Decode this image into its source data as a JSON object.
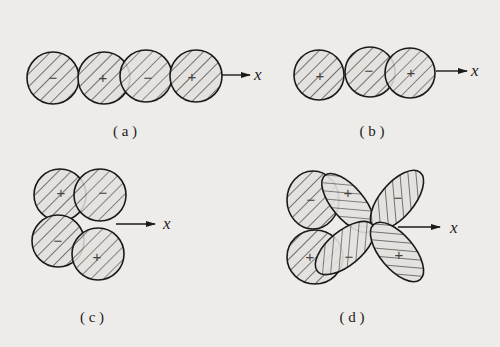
{
  "figure": {
    "panels": [
      {
        "id": "a",
        "caption": "( a )",
        "axis_label": "x",
        "lobes": [
          {
            "sign": "−"
          },
          {
            "sign": "+"
          },
          {
            "sign": "−"
          },
          {
            "sign": "+"
          }
        ]
      },
      {
        "id": "b",
        "caption": "( b )",
        "axis_label": "x",
        "lobes": [
          {
            "sign": "+"
          },
          {
            "sign": "−"
          },
          {
            "sign": "+"
          }
        ]
      },
      {
        "id": "c",
        "caption": "( c )",
        "axis_label": "x",
        "lobes": [
          {
            "sign": "+"
          },
          {
            "sign": "−"
          },
          {
            "sign": "−"
          },
          {
            "sign": "+"
          }
        ]
      },
      {
        "id": "d",
        "caption": "( d )",
        "axis_label": "x",
        "lobes": [
          {
            "sign": "−"
          },
          {
            "sign": "+"
          },
          {
            "sign": "+"
          },
          {
            "sign": "−"
          },
          {
            "sign": "−"
          },
          {
            "sign": "+"
          }
        ]
      }
    ]
  },
  "colors": {
    "stroke": "#1a1a1a",
    "hatch": "#2a2a2a",
    "fill": "#e2e0dc",
    "background": "#eeece8"
  }
}
